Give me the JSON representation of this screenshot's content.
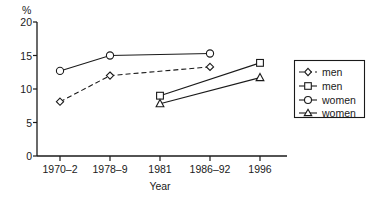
{
  "chart_data": {
    "type": "line",
    "title": "",
    "xlabel": "Year",
    "ylabel": "%",
    "categories": [
      "1970–2",
      "1978–9",
      "1981",
      "1986–92",
      "1996"
    ],
    "ylim": [
      0,
      20
    ],
    "yticks": [
      0,
      5,
      10,
      15,
      20
    ],
    "ytick_labels": [
      "0",
      "5",
      "10",
      "15",
      "20"
    ],
    "grid": false,
    "legend_position": "right",
    "series": [
      {
        "name": "men",
        "marker": "diamond",
        "line_style": "dashed",
        "x": [
          "1970–2",
          "1978–9",
          "1986–92"
        ],
        "values": [
          8.1,
          12.0,
          13.3
        ]
      },
      {
        "name": "men",
        "marker": "square",
        "line_style": "solid",
        "x": [
          "1981",
          "1996"
        ],
        "values": [
          9.0,
          13.9
        ]
      },
      {
        "name": "women",
        "marker": "circle",
        "line_style": "solid",
        "x": [
          "1970–2",
          "1978–9",
          "1986–92"
        ],
        "values": [
          12.7,
          15.0,
          15.3
        ]
      },
      {
        "name": "women",
        "marker": "triangle",
        "line_style": "solid",
        "x": [
          "1981",
          "1996"
        ],
        "values": [
          7.8,
          11.7
        ]
      }
    ]
  },
  "axes": {
    "y_unit_label": "%",
    "x_axis_title": "Year",
    "y_tick_labels": [
      "20",
      "15",
      "10",
      "5",
      "0"
    ],
    "x_tick_labels": [
      "1970–2",
      "1978–9",
      "1981",
      "1986–92",
      "1996"
    ]
  },
  "legend": {
    "entries": [
      {
        "label": "men",
        "marker": "diamond-icon",
        "line_style": "dashed"
      },
      {
        "label": "men",
        "marker": "square-icon",
        "line_style": "solid"
      },
      {
        "label": "women",
        "marker": "circle-icon",
        "line_style": "solid"
      },
      {
        "label": "women",
        "marker": "triangle-icon",
        "line_style": "solid"
      }
    ]
  },
  "colors": {
    "ink": "#1a1a1a",
    "background": "#ffffff",
    "marker_fill": "#ffffff"
  }
}
